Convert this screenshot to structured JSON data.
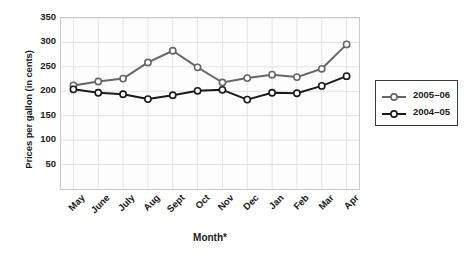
{
  "chart_data": {
    "type": "line",
    "title": "",
    "xlabel": "Month*",
    "ylabel": "Prices per gallon (in cents)",
    "categories": [
      "May",
      "June",
      "July",
      "Aug",
      "Sept",
      "Oct",
      "Nov",
      "Dec",
      "Jan",
      "Feb",
      "Mar",
      "Apr"
    ],
    "series": [
      {
        "name": "2005–06",
        "color": "#666666",
        "values": [
          212,
          220,
          226,
          259,
          283,
          249,
          218,
          227,
          234,
          229,
          246,
          296
        ]
      },
      {
        "name": "2004–05",
        "color": "#1a1a1a",
        "values": [
          204,
          197,
          194,
          184,
          192,
          201,
          203,
          183,
          197,
          196,
          211,
          231
        ]
      }
    ],
    "ylim": [
      0,
      350
    ],
    "yticks": [
      50,
      100,
      150,
      200,
      250,
      300,
      350
    ],
    "ytick_labels": [
      "50",
      "100",
      "150",
      "200",
      "250",
      "300",
      "350"
    ],
    "grid": true,
    "legend_position": "right",
    "marker": "open-circle",
    "plot_background": "#fdfdfd",
    "grid_color": "#e2e2e2",
    "border_color": "#c9c9c9"
  },
  "legend": {
    "entries": [
      {
        "label": "2005–06"
      },
      {
        "label": "2004–05"
      }
    ]
  }
}
